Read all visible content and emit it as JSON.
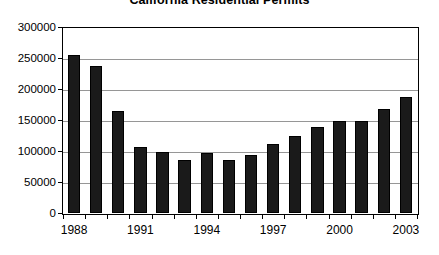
{
  "chart_data": {
    "type": "bar",
    "title": "California Residential Permits",
    "xlabel": "",
    "ylabel": "",
    "ylim": [
      0,
      300000
    ],
    "ytick_step": 50000,
    "grid": true,
    "legend": false,
    "bar_color": "#1a1a1a",
    "gridline_color": "#969696",
    "axis_color": "#000000",
    "categories": [
      "1988",
      "1989",
      "1990",
      "1991",
      "1992",
      "1993",
      "1994",
      "1995",
      "1996",
      "1997",
      "1998",
      "1999",
      "2000",
      "2001",
      "2002",
      "2003"
    ],
    "values": [
      255000,
      237000,
      164000,
      107000,
      98000,
      85000,
      97000,
      86000,
      94000,
      111000,
      124000,
      139000,
      149000,
      149000,
      168000,
      187000
    ],
    "ytick_labels": [
      "0",
      "50000",
      "100000",
      "150000",
      "200000",
      "250000",
      "300000"
    ],
    "ytick_values": [
      0,
      50000,
      100000,
      150000,
      200000,
      250000,
      300000
    ],
    "xtick_labels": [
      "1988",
      "1991",
      "1994",
      "1997",
      "2000",
      "2003"
    ],
    "xtick_categories": [
      "1988",
      "1991",
      "1994",
      "1997",
      "2000",
      "2003"
    ]
  }
}
